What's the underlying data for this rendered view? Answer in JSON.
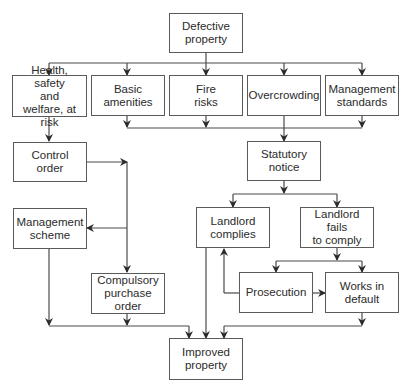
{
  "diagram": {
    "type": "flowchart",
    "colors": {
      "line": "#4a4a4a",
      "border": "#5a5a5a",
      "text": "#2b2b2b",
      "background": "#ffffff"
    },
    "nodes": {
      "defective_property": "Defective\nproperty",
      "health_safety": "Health, safety\nand\nwelfare, at risk",
      "basic_amenities": "Basic\namenities",
      "fire_risks": "Fire\nrisks",
      "overcrowding": "Overcrowding",
      "management_standards": "Management\nstandards",
      "control_order": "Control\norder",
      "management_scheme": "Management\nscheme",
      "compulsory_purchase_order": "Compulsory\npurchase\norder",
      "statutory_notice": "Statutory\nnotice",
      "landlord_complies": "Landlord\ncomplies",
      "landlord_fails": "Landlord fails\nto comply",
      "prosecution": "Prosecution",
      "works_in_default": "Works in\ndefault",
      "improved_property": "Improved\nproperty"
    },
    "edges": [
      [
        "Defective property",
        "Health, safety and welfare, at risk"
      ],
      [
        "Defective property",
        "Basic amenities"
      ],
      [
        "Defective property",
        "Fire risks"
      ],
      [
        "Defective property",
        "Overcrowding"
      ],
      [
        "Defective property",
        "Management standards"
      ],
      [
        "Health, safety and welfare, at risk",
        "Control order"
      ],
      [
        "Control order",
        "Management scheme"
      ],
      [
        "Control order",
        "Compulsory purchase order"
      ],
      [
        "Basic amenities",
        "Statutory notice"
      ],
      [
        "Fire risks",
        "Statutory notice"
      ],
      [
        "Overcrowding",
        "Statutory notice"
      ],
      [
        "Management standards",
        "Statutory notice"
      ],
      [
        "Statutory notice",
        "Landlord complies"
      ],
      [
        "Statutory notice",
        "Landlord fails to comply"
      ],
      [
        "Landlord fails to comply",
        "Prosecution"
      ],
      [
        "Landlord fails to comply",
        "Works in default"
      ],
      [
        "Prosecution",
        "Landlord complies"
      ],
      [
        "Prosecution",
        "Works in default"
      ],
      [
        "Management scheme",
        "Improved property"
      ],
      [
        "Compulsory purchase order",
        "Improved property"
      ],
      [
        "Landlord complies",
        "Improved property"
      ],
      [
        "Works in default",
        "Improved property"
      ]
    ]
  }
}
